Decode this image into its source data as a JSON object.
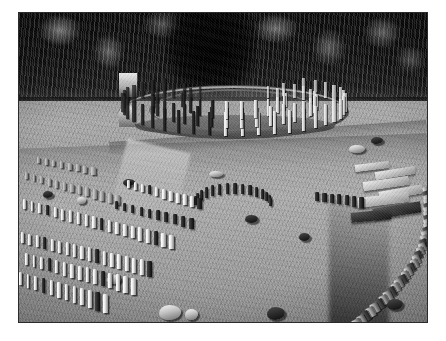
{
  "page": {
    "background_color": "#ffffff",
    "width": 446,
    "height": 341
  },
  "photo": {
    "kind": "photograph",
    "color_mode": "black-and-white",
    "caption": "",
    "frame": {
      "border_color": "#2b2b2b",
      "border_width_px": 1,
      "margin_color": "#ffffff",
      "left": 18,
      "top": 12,
      "width": 410,
      "height": 311
    },
    "subject": "Aerial view of an archaeological sanctuary site with circular and rectangular alignments of stone pillars in a grass clearing surrounded by dense forest",
    "regions": [
      {
        "name": "forest-canopy",
        "description": "Dark coniferous and deciduous forest filling the upper third of the frame",
        "tone": "very dark"
      },
      {
        "name": "circular-sanctuary",
        "description": "Large circular sanctuary of concentric rings of upright posts with a central structure",
        "tone": "light posts on dark ground"
      },
      {
        "name": "grass-clearing",
        "description": "Sunlit mown grass terrace occupying the middle and lower frame",
        "tone": "mid grey"
      },
      {
        "name": "rectangular-sanctuary",
        "description": "Rows of short limestone pillars arranged in rectangular alignments at lower left",
        "tone": "bright pillars with dark cast shadows"
      },
      {
        "name": "small-arc-sanctuary",
        "description": "Small arc of dark pillars in the centre of the clearing",
        "tone": "dark"
      },
      {
        "name": "stone-terrace",
        "description": "Cut stone slabs and steps at the right edge",
        "tone": "light grey"
      },
      {
        "name": "retaining-wall",
        "description": "Curving dry-stone retaining wall descending along the right side",
        "tone": "mixed light and dark"
      },
      {
        "name": "scattered-boulders",
        "description": "Isolated pale boulders and dark stone blocks scattered across the grass",
        "tone": "mixed"
      }
    ],
    "palette": {
      "forest_dark": "#0e0e0e",
      "forest_highlight": "#d7d7d7",
      "grass_mid": "#a2a2a2",
      "grass_light": "#b4b4b4",
      "grass_shadow": "#7c7c7c",
      "stone_light": "#fafafa",
      "stone_dark": "#1a1a1a",
      "frame_border": "#2b2b2b",
      "page_background": "#ffffff"
    }
  }
}
